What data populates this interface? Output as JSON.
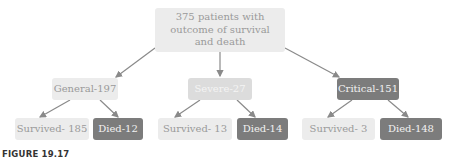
{
  "root": {
    "label": "375 patients with outcome of survival and death"
  },
  "categories": [
    {
      "label": "General-197",
      "survived": "Survived- 185",
      "died": "Died-12"
    },
    {
      "label": "Severe-27",
      "survived": "Survived- 13",
      "died": "Died-14"
    },
    {
      "label": "Critical-151",
      "survived": "Survived- 3",
      "died": "Died-148"
    }
  ],
  "caption": "FIGURE 19.17",
  "colors": {
    "light": "#ececec",
    "mid": "#dcdcdc",
    "dark": "#7c7c7c",
    "arrow": "#8a8a8a"
  }
}
